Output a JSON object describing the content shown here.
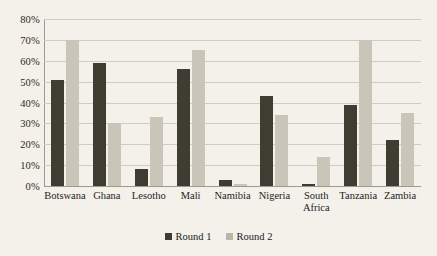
{
  "chart_data": {
    "type": "bar",
    "title": "",
    "xlabel": "",
    "ylabel": "",
    "ylim": [
      0,
      80
    ],
    "grid": true,
    "legend_position": "bottom-center",
    "ytick_labels": [
      "80%",
      "70%",
      "60%",
      "50%",
      "40%",
      "30%",
      "20%",
      "10%",
      "0%"
    ],
    "ytick_values": [
      80,
      70,
      60,
      50,
      40,
      30,
      20,
      10,
      0
    ],
    "categories": [
      "Botswana",
      "Ghana",
      "Lesotho",
      "Mali",
      "Namibia",
      "Nigeria",
      "South\nAfrica",
      "Tanzania",
      "Zambia"
    ],
    "series": [
      {
        "name": "Round 1",
        "color": "#3f3c31",
        "values": [
          51,
          59,
          8,
          56,
          3,
          43,
          1,
          39,
          22
        ]
      },
      {
        "name": "Round 2",
        "color": "#c9c6b9",
        "values": [
          70,
          30,
          33,
          65,
          1,
          34,
          14,
          70,
          35
        ]
      }
    ]
  },
  "colors": {
    "background": "#f3f1ea",
    "gridline": "#cfccc1",
    "axis": "#9c998d",
    "text": "#22211d",
    "round1": "#3f3c31",
    "round2": "#c9c6b9"
  }
}
